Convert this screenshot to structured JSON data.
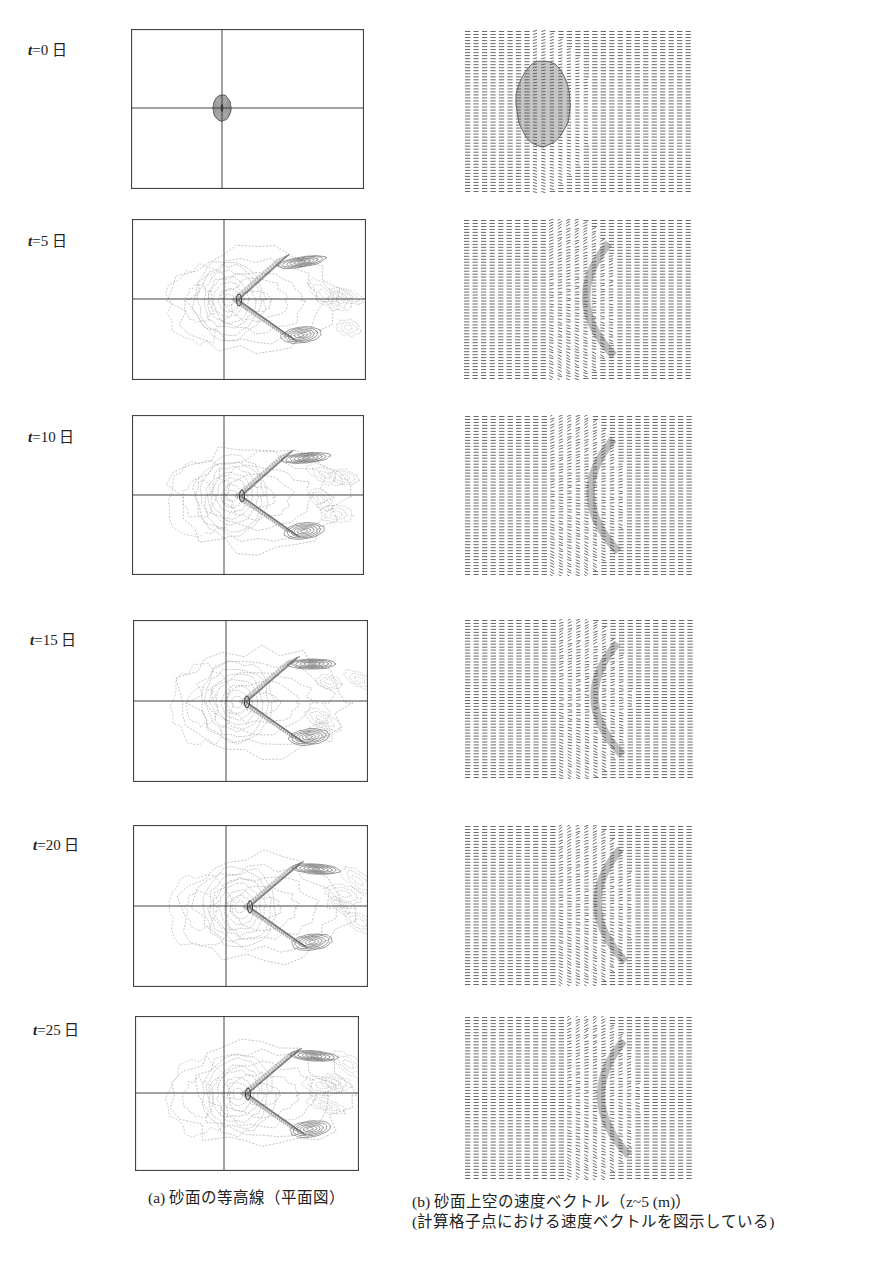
{
  "figure": {
    "rows": [
      {
        "t_var": "t",
        "t_rest": "=0 日",
        "label_pos": [
          28,
          38
        ],
        "contour": {
          "x": 131,
          "y": 29,
          "w": 233,
          "h": 160,
          "cx": 91,
          "cy": 79
        },
        "vector": {
          "x": 463,
          "y": 30,
          "w": 229,
          "h": 163
        },
        "stage": 0
      },
      {
        "t_var": "t",
        "t_rest": "=5 日",
        "label_pos": [
          28,
          229
        ],
        "contour": {
          "x": 132,
          "y": 219,
          "w": 234,
          "h": 161,
          "cx": 92,
          "cy": 80
        },
        "vector": {
          "x": 462,
          "y": 219,
          "w": 230,
          "h": 161
        },
        "stage": 1
      },
      {
        "t_var": "t",
        "t_rest": "=10 日",
        "label_pos": [
          28,
          425
        ],
        "contour": {
          "x": 132,
          "y": 415,
          "w": 232,
          "h": 160,
          "cx": 92,
          "cy": 80
        },
        "vector": {
          "x": 463,
          "y": 415,
          "w": 230,
          "h": 161
        },
        "stage": 2
      },
      {
        "t_var": "t",
        "t_rest": "=15 日",
        "label_pos": [
          30,
          628
        ],
        "contour": {
          "x": 133,
          "y": 620,
          "w": 235,
          "h": 162,
          "cx": 93,
          "cy": 81
        },
        "vector": {
          "x": 463,
          "y": 619,
          "w": 231,
          "h": 160
        },
        "stage": 3
      },
      {
        "t_var": "t",
        "t_rest": "=20 日",
        "label_pos": [
          33,
          833
        ],
        "contour": {
          "x": 133,
          "y": 825,
          "w": 235,
          "h": 162,
          "cx": 93,
          "cy": 81
        },
        "vector": {
          "x": 463,
          "y": 825,
          "w": 230,
          "h": 161
        },
        "stage": 4
      },
      {
        "t_var": "t",
        "t_rest": "=25 日",
        "label_pos": [
          33,
          1018
        ],
        "contour": {
          "x": 135,
          "y": 1016,
          "w": 224,
          "h": 155,
          "cx": 89,
          "cy": 77
        },
        "vector": {
          "x": 463,
          "y": 1016,
          "w": 230,
          "h": 164
        },
        "stage": 5
      }
    ],
    "captions": {
      "a": {
        "text": "(a) 砂面の等高線（平面図）",
        "pos": [
          148,
          1188
        ]
      },
      "b_line1": {
        "text": "(b) 砂面上空の速度ベクトル（z~5 (m)）",
        "pos": [
          412,
          1192
        ]
      },
      "b_line2": {
        "text": "(計算格子点における速度ベクトルを図示している)",
        "pos": [
          412,
          1212
        ]
      }
    },
    "colors": {
      "frame": "#444444",
      "contour_light": "#9a9a9a",
      "contour_dark": "#555555",
      "vector": "#5a5a5a"
    }
  }
}
